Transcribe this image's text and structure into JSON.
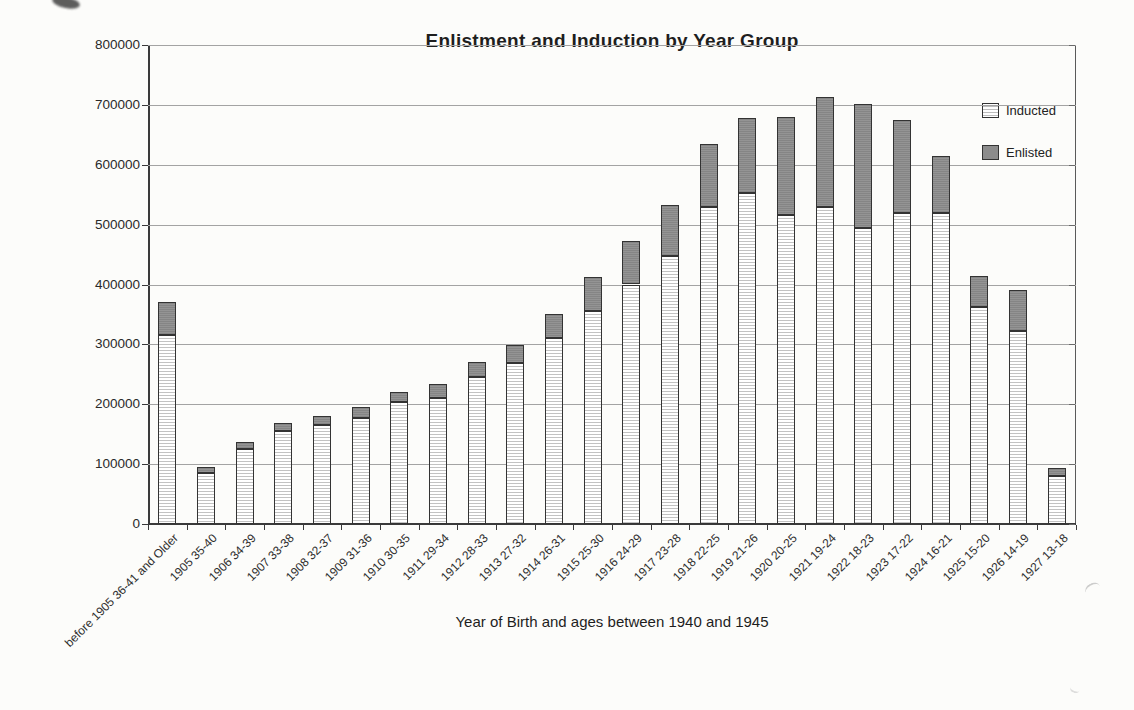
{
  "chart_data": {
    "type": "bar",
    "stacked": true,
    "title": "Enlistment and Induction by Year Group",
    "xlabel": "Year of Birth and ages between 1940 and 1945",
    "ylabel": "",
    "ylim": [
      0,
      800000
    ],
    "ytick_step": 100000,
    "y_tick_labels": [
      "0",
      "100000",
      "200000",
      "300000",
      "400000",
      "500000",
      "600000",
      "700000",
      "800000"
    ],
    "grid": true,
    "legend_position": "top-right-inside",
    "categories": [
      "before 1905 36-41 and Older",
      "1905 35-40",
      "1906 34-39",
      "1907 33-38",
      "1908 32-37",
      "1909 31-36",
      "1910 30-35",
      "1911 29-34",
      "1912 28-33",
      "1913 27-32",
      "1914 26-31",
      "1915 25-30",
      "1916 24-29",
      "1917 23-28",
      "1918 22-25",
      "1919 21-26",
      "1920 20-25",
      "1921 19-24",
      "1922 18-23",
      "1923 17-22",
      "1924 16-21",
      "1925 15-20",
      "1926 14-19",
      "1927 13-18"
    ],
    "series": [
      {
        "name": "Inducted",
        "swatch": "white with light horizontal hatch lines",
        "values": [
          315000,
          86000,
          126000,
          155000,
          165000,
          177000,
          204000,
          210000,
          245000,
          269000,
          310000,
          355000,
          400000,
          448000,
          529000,
          552000,
          516000,
          530000,
          495000,
          519000,
          520000,
          363000,
          322000,
          80000
        ]
      },
      {
        "name": "Enlisted",
        "swatch": "medium gray",
        "values": [
          55000,
          10000,
          11000,
          13000,
          15000,
          18000,
          17000,
          24000,
          26000,
          30000,
          41000,
          57000,
          72000,
          84000,
          106000,
          126000,
          163000,
          183000,
          207000,
          155000,
          95000,
          52000,
          68000,
          13000
        ]
      }
    ]
  },
  "colors": {
    "background": "#fcfcfa",
    "enlisted_fill": "#8c8c8c",
    "inducted_hatch_line": "#c2c2c2",
    "bar_outline": "#333333",
    "gridline": "#a3a3a3",
    "axis": "#3a3a3a",
    "text": "#262626"
  }
}
